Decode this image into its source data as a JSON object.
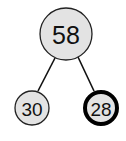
{
  "tree": {
    "nodes": [
      {
        "id": "root",
        "value": "58",
        "highlighted": false
      },
      {
        "id": "left",
        "value": "30",
        "highlighted": false
      },
      {
        "id": "right",
        "value": "28",
        "highlighted": true
      }
    ],
    "edges": [
      {
        "from": "root",
        "to": "left"
      },
      {
        "from": "root",
        "to": "right"
      }
    ]
  }
}
